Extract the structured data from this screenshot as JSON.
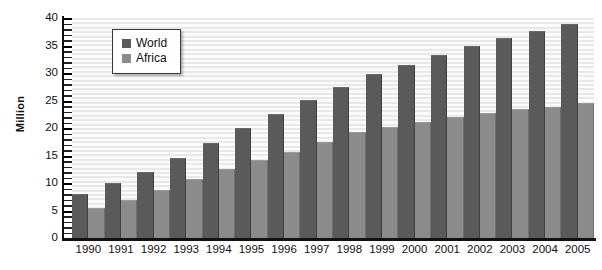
{
  "chart_data": {
    "type": "bar",
    "title": "",
    "subtitle": "",
    "xlabel": "",
    "ylabel": "Million",
    "ylim": [
      0,
      40
    ],
    "ytick_step": 5,
    "yticks": [
      40,
      35,
      30,
      25,
      20,
      15,
      10,
      5,
      0
    ],
    "grid": true,
    "grid_orientation": "horizontal",
    "legend_position": "top-left-inset",
    "categories": [
      "1990",
      "1991",
      "1992",
      "1993",
      "1994",
      "1995",
      "1996",
      "1997",
      "1998",
      "1999",
      "2000",
      "2001",
      "2002",
      "2003",
      "2004",
      "2005"
    ],
    "series": [
      {
        "name": "World",
        "color": "#5a5a5a",
        "values": [
          7.8,
          9.9,
          11.8,
          14.4,
          17.1,
          19.8,
          22.4,
          25.0,
          27.2,
          29.6,
          31.2,
          33.1,
          34.8,
          36.2,
          37.5,
          38.8
        ]
      },
      {
        "name": "Africa",
        "color": "#8b8b8b",
        "values": [
          5.2,
          6.8,
          8.6,
          10.5,
          12.3,
          14.0,
          15.4,
          17.2,
          19.1,
          20.0,
          21.0,
          21.9,
          22.5,
          23.2,
          23.6,
          24.3
        ]
      }
    ]
  },
  "axes": {
    "y_title": "Million",
    "y_tick_labels": [
      "40",
      "35",
      "30",
      "25",
      "20",
      "15",
      "10",
      "5",
      "0"
    ],
    "x_tick_labels": [
      "1990",
      "1991",
      "1992",
      "1993",
      "1994",
      "1995",
      "1996",
      "1997",
      "1998",
      "1999",
      "2000",
      "2001",
      "2002",
      "2003",
      "2004",
      "2005"
    ]
  },
  "legend": {
    "entries": [
      {
        "label": "World",
        "color": "#5a5a5a"
      },
      {
        "label": "Africa",
        "color": "#8b8b8b"
      }
    ]
  },
  "colors": {
    "world": "#5a5a5a",
    "africa": "#8b8b8b",
    "axis": "#111111",
    "plot_background_light": "#fbfbfb",
    "plot_background_stripe": "#e8e8e8",
    "page_background": "#ffffff"
  }
}
